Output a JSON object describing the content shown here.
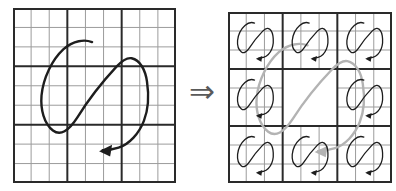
{
  "figure": {
    "background": "#ffffff",
    "implication_arrow": {
      "symbol": "⇒",
      "color": "#5a5a5a"
    },
    "colors": {
      "fine_grid": "#9c9c9c",
      "block_grid": "#2a2a2a",
      "curve_dark": "#1d1d1d",
      "curve_gray": "#b3b3b3"
    },
    "left_panel": {
      "grid_cols": 9,
      "grid_rows": 9,
      "block_every": 3,
      "curve": "large-s-loop-with-left-arrowhead"
    },
    "right_panel": {
      "block_cols": 3,
      "block_rows": 3,
      "fine_cells_per_block": 3,
      "center_block_empty": true,
      "small_curve_blocks": [
        [
          0,
          0
        ],
        [
          1,
          0
        ],
        [
          2,
          0
        ],
        [
          0,
          1
        ],
        [
          2,
          1
        ],
        [
          0,
          2
        ],
        [
          1,
          2
        ],
        [
          2,
          2
        ]
      ],
      "small_curve": "mini-s-loop-with-left-arrowhead",
      "overlay_curve": "large-gray-s-loop-with-left-arrowhead"
    }
  }
}
